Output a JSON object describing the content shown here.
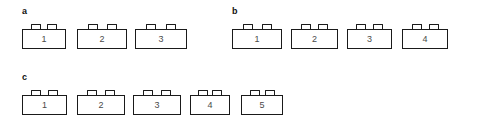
{
  "figure": {
    "background_color": "#ffffff",
    "line_color": "#1a1a1a",
    "number_color": "#4a4a4a",
    "label_color": "#111111"
  },
  "panels": [
    {
      "label": "a",
      "brick_count": 3,
      "bricks": [
        {
          "number": "1",
          "width": 44,
          "gap_after": 11
        },
        {
          "number": "2",
          "width": 50,
          "gap_after": 8
        },
        {
          "number": "3",
          "width": 52,
          "gap_after": 0
        }
      ]
    },
    {
      "label": "b",
      "brick_count": 4,
      "bricks": [
        {
          "number": "1",
          "width": 50,
          "gap_after": 9
        },
        {
          "number": "2",
          "width": 47,
          "gap_after": 9
        },
        {
          "number": "3",
          "width": 45,
          "gap_after": 10
        },
        {
          "number": "4",
          "width": 46,
          "gap_after": 0
        }
      ]
    },
    {
      "label": "c",
      "brick_count": 5,
      "bricks": [
        {
          "number": "1",
          "width": 45,
          "gap_after": 10
        },
        {
          "number": "2",
          "width": 48,
          "gap_after": 8
        },
        {
          "number": "3",
          "width": 48,
          "gap_after": 9
        },
        {
          "number": "4",
          "width": 40,
          "gap_after": 11
        },
        {
          "number": "5",
          "width": 42,
          "gap_after": 0
        }
      ]
    }
  ]
}
